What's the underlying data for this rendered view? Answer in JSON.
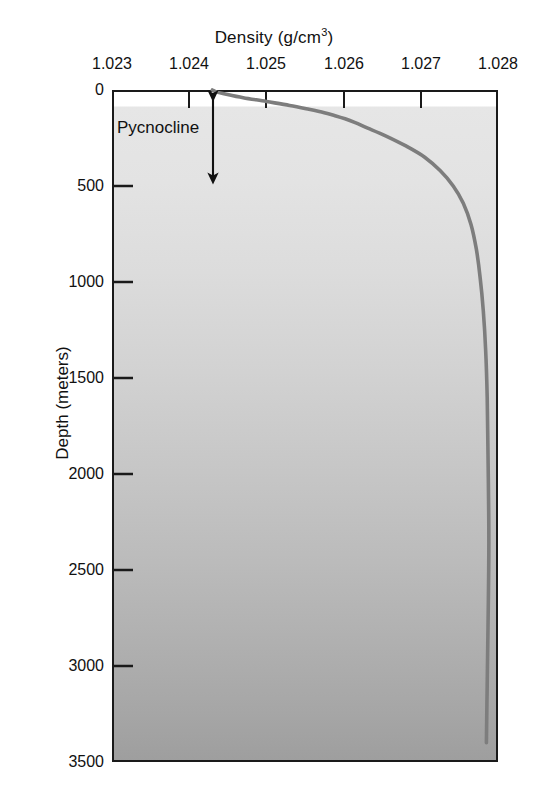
{
  "chart_data": {
    "type": "line",
    "title": "Density (g/cm3)",
    "title_main": "Density (g/cm",
    "title_sup": "3",
    "title_close": ")",
    "xlabel": "Density (g/cm3)",
    "ylabel": "Depth (meters)",
    "xlim": [
      1.023,
      1.028
    ],
    "ylim": [
      0,
      3500
    ],
    "y_inverted": true,
    "grid": false,
    "legend": null,
    "xticks": [
      "1.023",
      "1.024",
      "1.025",
      "1.026",
      "1.027",
      "1.028"
    ],
    "xtick_values": [
      1.023,
      1.024,
      1.025,
      1.026,
      1.027,
      1.028
    ],
    "yticks": [
      "0",
      "500",
      "1000",
      "1500",
      "2000",
      "2500",
      "3000",
      "3500"
    ],
    "ytick_values": [
      0,
      500,
      1000,
      1500,
      2000,
      2500,
      3000,
      3500
    ],
    "series": [
      {
        "name": "Density profile",
        "color": "#7d7d7d",
        "x": [
          1.0243,
          1.02435,
          1.02448,
          1.0247,
          1.025,
          1.0253,
          1.02555,
          1.02575,
          1.0259,
          1.02602,
          1.02615,
          1.02632,
          1.02655,
          1.0268,
          1.02705,
          1.02725,
          1.02742,
          1.02755,
          1.02765,
          1.02772,
          1.02777,
          1.02781,
          1.02784,
          1.02786,
          1.02787,
          1.02788,
          1.02788,
          1.02787,
          1.02786,
          1.02785
        ],
        "y": [
          0,
          10,
          22,
          40,
          60,
          80,
          100,
          118,
          135,
          150,
          170,
          200,
          240,
          290,
          350,
          420,
          500,
          590,
          700,
          830,
          980,
          1150,
          1350,
          1600,
          1900,
          2200,
          2500,
          2800,
          3100,
          3400
        ]
      }
    ],
    "annotations": [
      {
        "label": "Pycnocline",
        "type": "double-arrow",
        "depth_from": 30,
        "depth_to": 460
      }
    ]
  },
  "colors": {
    "line": "#7d7a7a",
    "axis": "#1a1a1a",
    "text": "#111111",
    "fill_top": "#ffffff",
    "fill_bottom": "#9e9e9e"
  }
}
